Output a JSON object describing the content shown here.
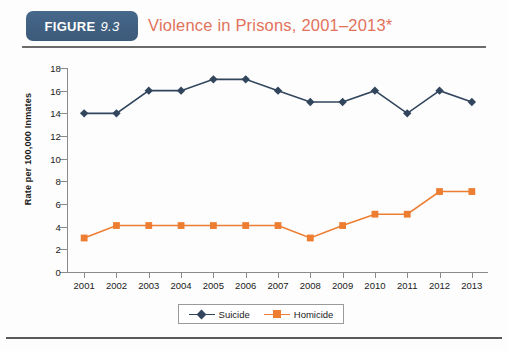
{
  "header": {
    "badge_word": "FIGURE",
    "badge_number": "9.3",
    "badge_color": "#3f5f80",
    "title": "Violence in Prisons, 2001–2013*",
    "title_color": "#e2725b"
  },
  "legend": {
    "position": "bottom-center",
    "items": [
      {
        "label": "Suicide",
        "color": "#31455c",
        "marker": "diamond"
      },
      {
        "label": "Homicide",
        "color": "#ed7d31",
        "marker": "square"
      }
    ]
  },
  "chart_data": {
    "type": "line",
    "title": "Violence in Prisons, 2001–2013*",
    "xlabel": "",
    "ylabel": "Rate per 100,000 Inmates",
    "categories": [
      "2001",
      "2002",
      "2003",
      "2004",
      "2005",
      "2006",
      "2007",
      "2008",
      "2009",
      "2010",
      "2011",
      "2012",
      "2013"
    ],
    "x": [
      2001,
      2002,
      2003,
      2004,
      2005,
      2006,
      2007,
      2008,
      2009,
      2010,
      2011,
      2012,
      2013
    ],
    "series": [
      {
        "name": "Suicide",
        "color": "#31455c",
        "marker": "diamond",
        "values": [
          14,
          14,
          16,
          16,
          17,
          17,
          16,
          15,
          15,
          16,
          14,
          16,
          15
        ]
      },
      {
        "name": "Homicide",
        "color": "#ed7d31",
        "marker": "square",
        "values": [
          3,
          4.1,
          4.1,
          4.1,
          4.1,
          4.1,
          4.1,
          3,
          4.1,
          5.1,
          5.1,
          7.1,
          7.1
        ]
      }
    ],
    "ylim": [
      0,
      18
    ],
    "yticks": [
      0,
      2,
      4,
      6,
      8,
      10,
      12,
      14,
      16,
      18
    ],
    "ytick_labels": [
      "0",
      "2",
      "4",
      "6",
      "8",
      "10",
      "12",
      "14",
      "16",
      "18"
    ],
    "grid": false,
    "legend_position": "bottom-center"
  }
}
